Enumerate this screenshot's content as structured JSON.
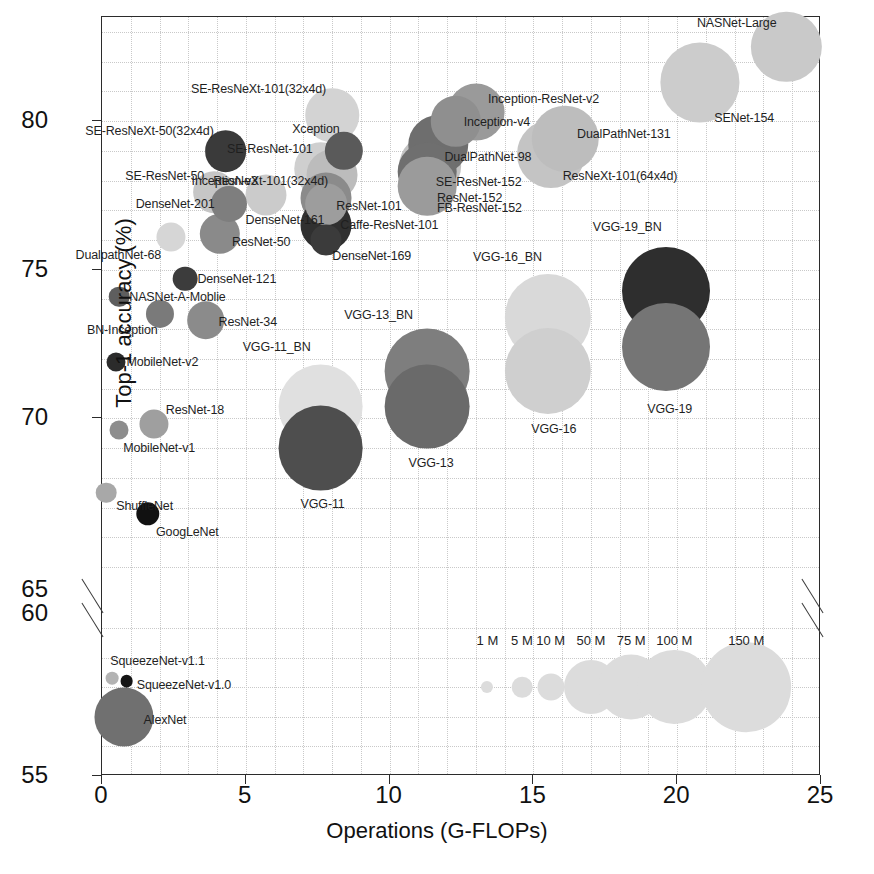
{
  "chart_data": {
    "type": "scatter",
    "title": "",
    "xlabel": "Operations (G-FLOPs)",
    "ylabel": "Top-1 accuracy (%)",
    "xlim": [
      0,
      25
    ],
    "ylim_lower": [
      55,
      60
    ],
    "ylim_upper": [
      60,
      83.5
    ],
    "axis_break": true,
    "grid": true,
    "xticks": [
      "0",
      "5",
      "10",
      "15",
      "20",
      "25"
    ],
    "yticks_upper": [
      "80",
      "75",
      "70",
      "65"
    ],
    "yticks_lower": [
      "60",
      "55"
    ],
    "bubble_size_meaning": "Number of parameters",
    "size_legend": [
      {
        "label": "1 M",
        "value": 1
      },
      {
        "label": "5 M",
        "value": 5
      },
      {
        "label": "10 M",
        "value": 10
      },
      {
        "label": "50 M",
        "value": 50
      },
      {
        "label": "75 M",
        "value": 75
      },
      {
        "label": "100 M",
        "value": 100
      },
      {
        "label": "150 M",
        "value": 150
      }
    ],
    "points": [
      {
        "name": "NASNet-Large",
        "x": 23.8,
        "y": 82.5,
        "params": 89,
        "shade": "#c9c9c9",
        "lx": -10,
        "ly": -24,
        "align": "r"
      },
      {
        "name": "SENet-154",
        "x": 20.8,
        "y": 81.3,
        "params": 115,
        "shade": "#cccccc",
        "lx": 14,
        "ly": 36,
        "align": "l"
      },
      {
        "name": "SE-ResNeXt-101(32x4d)",
        "x": 8.0,
        "y": 80.2,
        "params": 49,
        "shade": "#d3d3d3",
        "lx": -6,
        "ly": -26,
        "align": "r"
      },
      {
        "name": "Inception-ResNet-v2",
        "x": 13.0,
        "y": 80.3,
        "params": 56,
        "shade": "#9a9a9a",
        "lx": 12,
        "ly": -13,
        "align": "l"
      },
      {
        "name": "Inception-v4",
        "x": 12.3,
        "y": 80.0,
        "params": 43,
        "shade": "#8f8f8f",
        "lx": 8,
        "ly": 1,
        "align": "l"
      },
      {
        "name": "DualPathNet-131",
        "x": 16.1,
        "y": 79.4,
        "params": 79,
        "shade": "#bdbdbd",
        "lx": 12,
        "ly": -5,
        "align": "l"
      },
      {
        "name": "SE-ResNeXt-50(32x4d)",
        "x": 4.3,
        "y": 79.0,
        "params": 28,
        "shade": "#3a3a3a",
        "lx": -12,
        "ly": -20,
        "align": "r"
      },
      {
        "name": "DualPathNet-98",
        "x": 11.7,
        "y": 79.2,
        "params": 62,
        "shade": "#6e6e6e",
        "lx": 6,
        "ly": 12,
        "align": "l"
      },
      {
        "name": "Xception",
        "x": 8.4,
        "y": 79.0,
        "params": 23,
        "shade": "#5a5a5a",
        "lx": -4,
        "ly": -22,
        "align": "r"
      },
      {
        "name": "SE-ResNet-152",
        "x": 11.4,
        "y": 78.5,
        "params": 67,
        "shade": "#c1c1c1",
        "lx": 6,
        "ly": 16,
        "align": "l"
      },
      {
        "name": "ResNeXt-101(64x4d)",
        "x": 15.6,
        "y": 78.9,
        "params": 83,
        "shade": "#c4c4c4",
        "lx": 12,
        "ly": 22,
        "align": "l"
      },
      {
        "name": "SE-ResNet-101",
        "x": 7.6,
        "y": 78.4,
        "params": 49,
        "shade": "#cfcfcf",
        "lx": -8,
        "ly": -20,
        "align": "r"
      },
      {
        "name": "ResNeXt-101(32x4d)",
        "x": 8.0,
        "y": 78.2,
        "params": 44,
        "shade": "#bcbcbc",
        "lx": -4,
        "ly": 6,
        "align": "r"
      },
      {
        "name": "ResNet-152",
        "x": 11.3,
        "y": 78.3,
        "params": 60,
        "shade": "#6f6f6f",
        "lx": 10,
        "ly": 26,
        "align": "l"
      },
      {
        "name": "SE-ResNet-50",
        "x": 3.9,
        "y": 77.6,
        "params": 28,
        "shade": "#c6c6c6",
        "lx": -10,
        "ly": -16,
        "align": "r"
      },
      {
        "name": "Inception-v3",
        "x": 5.7,
        "y": 77.5,
        "params": 27,
        "shade": "#cbcbcb",
        "lx": -8,
        "ly": -14,
        "align": "r"
      },
      {
        "name": "ResNet-101",
        "x": 7.8,
        "y": 77.4,
        "params": 44,
        "shade": "#8b8b8b",
        "lx": 10,
        "ly": 8,
        "align": "l"
      },
      {
        "name": "FB-ResNet-152",
        "x": 11.3,
        "y": 77.8,
        "params": 60,
        "shade": "#9b9b9b",
        "lx": 10,
        "ly": 22,
        "align": "l"
      },
      {
        "name": "DenseNet-201",
        "x": 4.4,
        "y": 77.2,
        "params": 20,
        "shade": "#7e7e7e",
        "lx": -14,
        "ly": 0,
        "align": "r"
      },
      {
        "name": "DenseNet-161",
        "x": 7.8,
        "y": 77.2,
        "params": 28,
        "shade": "#9d9d9d",
        "lx": -2,
        "ly": 16,
        "align": "r"
      },
      {
        "name": "ResNet-50",
        "x": 4.1,
        "y": 76.2,
        "params": 26,
        "shade": "#8a8a8a",
        "lx": 12,
        "ly": 8,
        "align": "l"
      },
      {
        "name": "Caffe-ResNet-101",
        "x": 7.8,
        "y": 76.5,
        "params": 44,
        "shade": "#303030",
        "lx": 14,
        "ly": 0,
        "align": "l"
      },
      {
        "name": "DenseNet-169",
        "x": 7.8,
        "y": 76.0,
        "params": 14,
        "shade": "#3b3b3b",
        "lx": 6,
        "ly": 16,
        "align": "l"
      },
      {
        "name": "DualpathNet-68",
        "x": 2.4,
        "y": 76.1,
        "params": 12,
        "shade": "#d6d6d6",
        "lx": -10,
        "ly": 18,
        "align": "r"
      },
      {
        "name": "DenseNet-121",
        "x": 2.9,
        "y": 74.7,
        "params": 8,
        "shade": "#3c3c3c",
        "lx": 12,
        "ly": 0,
        "align": "l"
      },
      {
        "name": "NASNet-A-Moblie",
        "x": 0.6,
        "y": 74.1,
        "params": 5,
        "shade": "#5e5e5e",
        "lx": 10,
        "ly": 0,
        "align": "l"
      },
      {
        "name": "BN-Inception",
        "x": 2.0,
        "y": 73.5,
        "params": 11,
        "shade": "#7a7a7a",
        "lx": -2,
        "ly": 16,
        "align": "r"
      },
      {
        "name": "ResNet-34",
        "x": 3.6,
        "y": 73.3,
        "params": 22,
        "shade": "#8b8b8b",
        "lx": 13,
        "ly": 2,
        "align": "l"
      },
      {
        "name": "MobileNet-v2",
        "x": 0.5,
        "y": 71.9,
        "params": 4,
        "shade": "#2b2b2b",
        "lx": 10,
        "ly": 0,
        "align": "l"
      },
      {
        "name": "VGG-11_BN",
        "x": 7.6,
        "y": 70.4,
        "params": 133,
        "shade": "#e0e0e0",
        "lx": -10,
        "ly": -60,
        "align": "r"
      },
      {
        "name": "VGG-11",
        "x": 7.6,
        "y": 69.0,
        "params": 133,
        "shade": "#4e4e4e",
        "lx": 2,
        "ly": 56,
        "align": "c"
      },
      {
        "name": "VGG-13_BN",
        "x": 11.3,
        "y": 71.6,
        "params": 133,
        "shade": "#7e7e7e",
        "lx": -14,
        "ly": -56,
        "align": "r"
      },
      {
        "name": "VGG-13",
        "x": 11.3,
        "y": 70.4,
        "params": 133,
        "shade": "#6a6a6a",
        "lx": 4,
        "ly": 56,
        "align": "c"
      },
      {
        "name": "VGG-16_BN",
        "x": 15.5,
        "y": 73.4,
        "params": 138,
        "shade": "#d9d9d9",
        "lx": -6,
        "ly": -60,
        "align": "r"
      },
      {
        "name": "VGG-16",
        "x": 15.5,
        "y": 71.6,
        "params": 138,
        "shade": "#cfcfcf",
        "lx": 6,
        "ly": 58,
        "align": "c"
      },
      {
        "name": "VGG-19_BN",
        "x": 19.6,
        "y": 74.3,
        "params": 144,
        "shade": "#2e2e2e",
        "lx": -4,
        "ly": -64,
        "align": "r"
      },
      {
        "name": "VGG-19",
        "x": 19.6,
        "y": 72.4,
        "params": 144,
        "shade": "#757575",
        "lx": 4,
        "ly": 62,
        "align": "c"
      },
      {
        "name": "ResNet-18",
        "x": 1.8,
        "y": 69.8,
        "params": 12,
        "shade": "#9f9f9f",
        "lx": 12,
        "ly": -14,
        "align": "l"
      },
      {
        "name": "MobileNet-v1",
        "x": 0.6,
        "y": 69.6,
        "params": 4,
        "shade": "#8d8d8d",
        "lx": 4,
        "ly": 18,
        "align": "l"
      },
      {
        "name": "ShuffleNet",
        "x": 0.15,
        "y": 67.5,
        "params": 5,
        "shade": "#a8a8a8",
        "lx": 10,
        "ly": 13,
        "align": "l"
      },
      {
        "name": "GoogLeNet",
        "x": 1.6,
        "y": 66.8,
        "params": 7,
        "shade": "#111111",
        "lx": 8,
        "ly": 18,
        "align": "l"
      },
      {
        "name": "SqueezeNet-v1.1",
        "x": 0.36,
        "y": 58.3,
        "params": 1.2,
        "shade": "#b3b3b3",
        "lx": -2,
        "ly": -17,
        "align": "l"
      },
      {
        "name": "SqueezeNet-v1.0",
        "x": 0.86,
        "y": 58.2,
        "params": 1.2,
        "shade": "#151515",
        "lx": 10,
        "ly": 4,
        "align": "l"
      },
      {
        "name": "AlexNet",
        "x": 0.75,
        "y": 57.0,
        "params": 61,
        "shade": "#707070",
        "lx": 20,
        "ly": 3,
        "align": "l"
      }
    ]
  }
}
